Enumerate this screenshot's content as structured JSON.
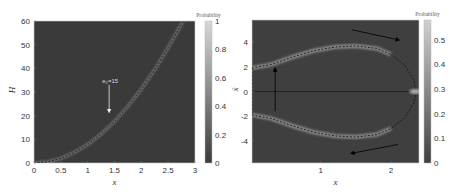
{
  "chart_data": [
    {
      "type": "heatmap",
      "title": "",
      "xlabel": "x",
      "ylabel": "H",
      "xlim": [
        0,
        3
      ],
      "ylim": [
        0,
        60
      ],
      "xticks": [
        0,
        0.5,
        1,
        1.5,
        2,
        2.5,
        3
      ],
      "xtick_labels": [
        "0",
        "0.5",
        "1",
        "1.5",
        "2",
        "2.5",
        "3"
      ],
      "yticks": [
        0,
        10,
        20,
        30,
        40,
        50,
        60
      ],
      "ytick_labels": [
        "0",
        "10",
        "20",
        "30",
        "40",
        "50",
        "60"
      ],
      "background_color": "#3a3a3a",
      "colorbar": {
        "title": "Probability",
        "range": [
          0,
          1
        ],
        "ticks": [
          0,
          0.2,
          0.4,
          0.6,
          0.8,
          1
        ],
        "tick_labels": [
          "0",
          "0.2",
          "0.4",
          "0.6",
          "0.8",
          "1"
        ],
        "colors": [
          "#3a3a3a",
          "#d8d8d8"
        ]
      },
      "series": [
        {
          "name": "high-probability band",
          "style": "light band",
          "x": [
            0,
            0.25,
            0.5,
            0.75,
            1.0,
            1.25,
            1.5,
            1.75,
            2.0,
            2.25,
            2.5,
            2.78
          ],
          "y": [
            0,
            0.5,
            1.9,
            4.4,
            7.8,
            12.2,
            17.5,
            23.9,
            31.2,
            39.5,
            48.8,
            60
          ]
        },
        {
          "name": "theoretical curve",
          "style": "dashed",
          "x": [
            0,
            0.25,
            0.5,
            0.75,
            1.0,
            1.25,
            1.5,
            1.75,
            2.0,
            2.25,
            2.5,
            2.78
          ],
          "y": [
            0,
            0.5,
            1.9,
            4.4,
            7.8,
            12.2,
            17.5,
            23.9,
            31.2,
            39.5,
            48.8,
            60
          ]
        }
      ],
      "annotations": [
        {
          "text": "e₀=15",
          "arrow_from": [
            1.4,
            33
          ],
          "arrow_to": [
            1.4,
            22
          ],
          "direction": "down"
        }
      ]
    },
    {
      "type": "heatmap",
      "title": "",
      "xlabel": "x",
      "ylabel": "ẋ",
      "xlim": [
        0.02,
        2.4
      ],
      "ylim": [
        -5.8,
        5.8
      ],
      "xticks": [
        1,
        2
      ],
      "xtick_labels": [
        "1",
        "2"
      ],
      "yticks": [
        4,
        2,
        0,
        -2,
        -4
      ],
      "ytick_labels": [
        "4",
        "2",
        "0",
        "-2",
        "-4"
      ],
      "background_color": "#3f3f3f",
      "colorbar": {
        "title": "Probability",
        "range": [
          0,
          0.58
        ],
        "ticks": [
          0,
          0.1,
          0.2,
          0.3,
          0.4,
          0.5
        ],
        "tick_labels": [
          "0",
          "0.1",
          "0.2",
          "0.3",
          "0.4",
          "0.5"
        ],
        "colors": [
          "#3f3f3f",
          "#d0d0d0"
        ]
      },
      "series": [
        {
          "name": "upper branch",
          "style": "light band + dashed",
          "x": [
            0.02,
            0.3,
            0.6,
            0.9,
            1.2,
            1.5,
            1.8,
            2.0
          ],
          "y": [
            1.9,
            2.2,
            2.8,
            3.3,
            3.6,
            3.7,
            3.5,
            3.0
          ]
        },
        {
          "name": "lower branch",
          "style": "light band + dashed",
          "x": [
            0.02,
            0.3,
            0.6,
            0.9,
            1.2,
            1.5,
            1.8,
            2.0
          ],
          "y": [
            -1.9,
            -2.2,
            -2.8,
            -3.3,
            -3.6,
            -3.7,
            -3.5,
            -3.0
          ]
        },
        {
          "name": "closing orbit",
          "style": "dashed",
          "x": [
            2.0,
            2.2,
            2.33,
            2.36,
            2.33,
            2.2,
            2.0
          ],
          "y": [
            3.0,
            2.1,
            0.9,
            0,
            -0.9,
            -2.1,
            -3.0
          ]
        },
        {
          "name": "left orbit edge",
          "style": "dashed",
          "x": [
            0.02,
            0.02
          ],
          "y": [
            1.9,
            -1.9
          ]
        },
        {
          "name": "zero line",
          "style": "solid",
          "x": [
            0.02,
            2.4
          ],
          "y": [
            0,
            0
          ]
        }
      ],
      "annotations": [
        {
          "text": "",
          "arrow_from": [
            0.35,
            -1.6
          ],
          "arrow_to": [
            0.35,
            1.8
          ],
          "direction": "up"
        },
        {
          "text": "",
          "arrow_from": [
            1.45,
            5.0
          ],
          "arrow_to": [
            2.1,
            4.2
          ],
          "direction": "down-right"
        },
        {
          "text": "",
          "arrow_from": [
            2.1,
            -4.3
          ],
          "arrow_to": [
            1.45,
            -5.0
          ],
          "direction": "down-left"
        },
        {
          "text": "",
          "highlight": "bright spot",
          "x": 2.35,
          "y": 0
        }
      ]
    }
  ]
}
